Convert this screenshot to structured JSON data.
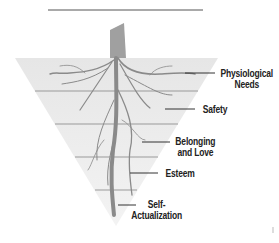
{
  "diagram": {
    "type": "inverted-pyramid-with-roots",
    "header_rule": true,
    "levels": [
      {
        "label_line1": "Physiological",
        "label_line2": "Needs"
      },
      {
        "label_line1": "Safety",
        "label_line2": ""
      },
      {
        "label_line1": "Belonging",
        "label_line2": "and Love"
      },
      {
        "label_line1": "Esteem",
        "label_line2": ""
      },
      {
        "label_line1": "Self-",
        "label_line2": "Actualization"
      }
    ],
    "colors": {
      "pyramid_fill": "#e4e4e4",
      "band_line": "#9a9a9a",
      "roots": "#8a8a8a",
      "trunk": "#999999",
      "leader_line": "#333333",
      "text": "#222222"
    }
  }
}
